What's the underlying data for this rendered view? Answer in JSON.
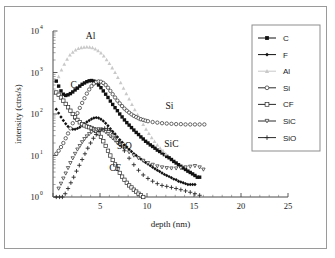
{
  "figure": {
    "frame_border_color": "#9a9a9a",
    "background": "#ffffff"
  },
  "chart_data": {
    "type": "scatter",
    "title": "",
    "xlabel": "depth (nm)",
    "ylabel": "intensity (ctns/s)",
    "xlim": [
      0,
      25
    ],
    "ylim": [
      1,
      10000
    ],
    "yscale": "log",
    "xscale": "linear",
    "grid": false,
    "xticks": [
      0,
      5,
      10,
      15,
      20,
      25
    ],
    "xticklabels": [
      "",
      "5",
      "10",
      "15",
      "20",
      "25"
    ],
    "yticks": [
      1,
      10,
      100,
      1000,
      10000
    ],
    "yticklabels": [
      "10",
      "10",
      "10",
      "10",
      "10"
    ],
    "ytick_exponents": [
      "0",
      "1",
      "2",
      "3",
      "4"
    ],
    "legend_position": "upper-right-outside",
    "annotations": [
      {
        "text": "Al",
        "x": 4.0,
        "y": 6500
      },
      {
        "text": "C",
        "x": 2.2,
        "y": 420
      },
      {
        "text": "Si",
        "x": 12.4,
        "y": 135
      },
      {
        "text": "SiC",
        "x": 12.6,
        "y": 16
      },
      {
        "text": "SiO",
        "x": 7.6,
        "y": 14
      },
      {
        "text": "CF",
        "x": 6.6,
        "y": 4.3
      }
    ],
    "series": [
      {
        "name": "C",
        "marker": "filled-square",
        "color": "#111111",
        "x": [
          0.35,
          0.6,
          0.85,
          1.1,
          1.35,
          1.6,
          1.85,
          2.1,
          2.35,
          2.6,
          2.85,
          3.1,
          3.35,
          3.6,
          3.85,
          4.1,
          4.35,
          4.6,
          4.85,
          5.1,
          5.35,
          5.6,
          5.85,
          6.1,
          6.35,
          6.6,
          6.85,
          7.1,
          7.35,
          7.6,
          7.85,
          8.1,
          8.35,
          8.6,
          8.85,
          9.1,
          9.35,
          9.6,
          9.85,
          10.1,
          10.35,
          10.6,
          10.85,
          11.1,
          11.35,
          11.6,
          11.85,
          12.1,
          12.35,
          12.6,
          12.85,
          13.1,
          13.35,
          13.6,
          13.85,
          14.1,
          14.35,
          14.6,
          14.85,
          15.1,
          15.35,
          15.6
        ],
        "y": [
          620,
          470,
          360,
          300,
          280,
          290,
          310,
          340,
          380,
          420,
          470,
          520,
          560,
          600,
          630,
          640,
          620,
          570,
          500,
          430,
          360,
          300,
          250,
          205,
          170,
          142,
          120,
          100,
          85,
          72,
          62,
          54,
          47,
          41,
          36,
          32,
          28,
          25,
          22,
          20,
          18,
          16.5,
          15,
          13.5,
          12.5,
          11.5,
          10.5,
          9.5,
          8.8,
          8,
          7.2,
          6.6,
          6,
          5.5,
          5,
          4.6,
          4.2,
          3.9,
          3.6,
          3.3,
          3,
          3
        ]
      },
      {
        "name": "F",
        "marker": "filled-diamond",
        "color": "#111111",
        "x": [
          0.35,
          0.6,
          0.85,
          1.1,
          1.35,
          1.6,
          1.85,
          2.1,
          2.35,
          2.6,
          2.85,
          3.1,
          3.35,
          3.6,
          3.85,
          4.1,
          4.35,
          4.6,
          4.85,
          5.1,
          5.35,
          5.6,
          5.85,
          6.1,
          6.35,
          6.6,
          6.85,
          7.1,
          7.35,
          7.6,
          7.85,
          8.1,
          8.35,
          8.6,
          8.85,
          9.1,
          9.35,
          9.6,
          9.85,
          10.1,
          10.35,
          10.6,
          10.85,
          11.1,
          11.35,
          11.6,
          11.85,
          12.1,
          12.35,
          12.6,
          12.85,
          13.1,
          13.35,
          13.6,
          13.85,
          14.1,
          14.35,
          14.6,
          14.85,
          15.1
        ],
        "y": [
          130,
          105,
          85,
          70,
          58,
          50,
          45,
          43,
          43,
          45,
          48,
          53,
          58,
          64,
          70,
          76,
          80,
          82,
          80,
          75,
          68,
          60,
          52,
          44,
          38,
          33,
          28,
          24,
          21,
          18,
          16,
          14,
          12.5,
          11,
          10,
          9,
          8.2,
          7.5,
          6.8,
          6.2,
          5.7,
          5.2,
          4.8,
          4.4,
          4.1,
          3.8,
          3.5,
          3.3,
          3.1,
          2.9,
          2.7,
          2.6,
          2.4,
          2.3,
          2.2,
          2.1,
          2,
          2,
          2,
          2
        ]
      },
      {
        "name": "Al",
        "marker": "filled-triangle-up",
        "color": "#c9c9c9",
        "x": [
          0.6,
          0.9,
          1.2,
          1.5,
          1.8,
          2.1,
          2.4,
          2.7,
          3.0,
          3.3,
          3.6,
          3.9,
          4.2,
          4.5,
          4.8,
          5.1,
          5.4,
          5.7,
          6.0,
          6.3,
          6.6,
          6.9,
          7.2,
          7.5,
          7.8,
          8.1,
          8.4,
          8.7,
          9.0,
          9.3,
          9.6,
          9.9,
          10.2,
          10.5,
          10.8,
          11.1,
          11.4,
          11.7,
          12.0
        ],
        "y": [
          800,
          1150,
          1600,
          2100,
          2650,
          3100,
          3500,
          3800,
          4000,
          4100,
          4150,
          4100,
          3950,
          3700,
          3350,
          2950,
          2500,
          2050,
          1650,
          1300,
          1000,
          760,
          570,
          420,
          310,
          230,
          170,
          128,
          96,
          73,
          56,
          43,
          34,
          27,
          22,
          18,
          15,
          13,
          11
        ]
      },
      {
        "name": "Si",
        "marker": "open-circle",
        "color": "#2b2b2b",
        "x": [
          0.35,
          0.6,
          0.85,
          1.1,
          1.35,
          1.6,
          1.85,
          2.1,
          2.35,
          2.6,
          2.85,
          3.1,
          3.35,
          3.6,
          3.85,
          4.1,
          4.35,
          4.6,
          4.85,
          5.1,
          5.35,
          5.6,
          5.85,
          6.1,
          6.35,
          6.6,
          6.85,
          7.1,
          7.35,
          7.6,
          7.85,
          8.1,
          8.35,
          8.6,
          8.85,
          9.1,
          9.35,
          9.6,
          9.85,
          10.1,
          10.6,
          11.1,
          11.6,
          12.1,
          12.6,
          13.1,
          13.6,
          14.1,
          14.6,
          15.1,
          15.6,
          16.1
        ],
        "y": [
          11,
          13,
          16,
          20,
          26,
          34,
          45,
          60,
          80,
          105,
          140,
          185,
          240,
          310,
          390,
          470,
          540,
          590,
          610,
          600,
          560,
          500,
          430,
          360,
          300,
          250,
          210,
          180,
          155,
          135,
          120,
          108,
          98,
          90,
          84,
          79,
          75,
          72,
          69,
          67,
          64,
          62,
          60,
          59,
          58,
          57,
          57,
          56,
          56,
          56,
          56,
          56
        ]
      },
      {
        "name": "CF",
        "marker": "open-square",
        "color": "#2b2b2b",
        "x": [
          0.35,
          0.6,
          0.85,
          1.1,
          1.35,
          1.6,
          1.85,
          2.1,
          2.35,
          2.6,
          2.85,
          3.1,
          3.35,
          3.6,
          3.85,
          4.1,
          4.35,
          4.6,
          4.85,
          5.1,
          5.35,
          5.6,
          5.85,
          6.1,
          6.35,
          6.6,
          6.85,
          7.1,
          7.35,
          7.6,
          7.85,
          8.1,
          8.35,
          8.6,
          8.85,
          9.1,
          9.35,
          9.6
        ],
        "y": [
          330,
          290,
          250,
          210,
          175,
          145,
          120,
          100,
          84,
          72,
          63,
          57,
          53,
          50,
          48,
          46,
          43,
          39,
          34,
          28,
          22,
          17,
          13,
          10,
          7.8,
          6.1,
          4.8,
          3.8,
          3.1,
          2.6,
          2.2,
          1.9,
          1.7,
          1.5,
          1.35,
          1.2,
          1.1,
          1.0
        ]
      },
      {
        "name": "SiC",
        "marker": "open-triangle-down",
        "color": "#2b2b2b",
        "x": [
          0.6,
          0.85,
          1.1,
          1.35,
          1.6,
          1.85,
          2.1,
          2.35,
          2.6,
          2.85,
          3.1,
          3.35,
          3.6,
          3.85,
          4.1,
          4.35,
          4.6,
          4.85,
          5.1,
          5.35,
          5.6,
          5.85,
          6.1,
          6.35,
          6.6,
          6.85,
          7.1,
          7.6,
          8.1,
          8.6,
          9.1,
          9.6,
          10.1,
          10.6,
          11.1,
          11.6,
          12.1,
          12.6,
          13.1,
          13.6,
          14.1,
          14.6,
          15.1,
          15.6,
          16.0
        ],
        "y": [
          1.6,
          2.1,
          2.8,
          3.7,
          5,
          6.6,
          8.6,
          11,
          14,
          17,
          21,
          25,
          29,
          33,
          37,
          40,
          42,
          43,
          42,
          40,
          37,
          33,
          29,
          26,
          23,
          20,
          18,
          14.5,
          12,
          10,
          8.6,
          7.5,
          6.6,
          6,
          5.5,
          5.2,
          5,
          4.9,
          4.9,
          5,
          5.2,
          5.4,
          5.6,
          5.2,
          4.6
        ]
      },
      {
        "name": "SiO",
        "marker": "plus",
        "color": "#2b2b2b",
        "x": [
          0.35,
          0.7,
          1.0,
          1.3,
          1.6,
          1.9,
          2.2,
          2.5,
          2.8,
          3.1,
          3.4,
          3.7,
          4.0,
          4.3,
          4.6,
          4.9,
          5.2,
          5.5,
          5.8,
          6.1,
          6.4,
          6.7,
          7.0,
          7.3,
          7.6,
          8.1,
          8.6,
          9.1,
          9.6,
          10.1,
          10.6,
          11.1,
          11.6,
          12.1,
          12.6,
          13.1,
          13.6,
          14.1,
          14.6,
          15.1,
          15.6
        ],
        "y": [
          1.0,
          1.0,
          1.0,
          1.2,
          1.6,
          2.2,
          3.0,
          4.2,
          5.8,
          8,
          11,
          15,
          20,
          26,
          32,
          38,
          43,
          45,
          44,
          40,
          34,
          28,
          22,
          17,
          13,
          8.6,
          6,
          4.4,
          3.4,
          2.8,
          2.4,
          2.1,
          1.9,
          1.8,
          1.7,
          1.6,
          1.5,
          1.4,
          1.3,
          1.2,
          1.1
        ]
      }
    ]
  },
  "legend": {
    "items": [
      {
        "label": "C",
        "marker": "filled-square",
        "color": "#111111"
      },
      {
        "label": "F",
        "marker": "filled-diamond",
        "color": "#111111"
      },
      {
        "label": "Al",
        "marker": "filled-triangle-up",
        "color": "#c9c9c9"
      },
      {
        "label": "Si",
        "marker": "open-circle",
        "color": "#2b2b2b"
      },
      {
        "label": "CF",
        "marker": "open-square",
        "color": "#2b2b2b"
      },
      {
        "label": "SiC",
        "marker": "open-triangle-down",
        "color": "#2b2b2b"
      },
      {
        "label": "SiO",
        "marker": "plus",
        "color": "#2b2b2b"
      }
    ]
  }
}
